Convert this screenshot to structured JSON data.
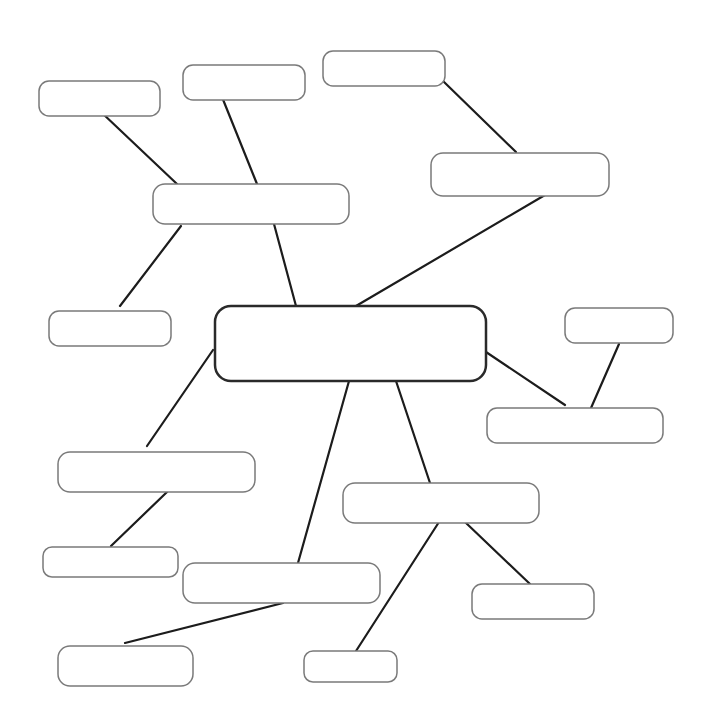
{
  "diagram": {
    "type": "mind-map",
    "width": 708,
    "height": 726,
    "colors": {
      "background": "#ffffff",
      "node_border": "#7a7a7a",
      "central_border": "#2a2a2a",
      "edge": "#1c1c1c"
    },
    "central": {
      "id": "center",
      "label": "",
      "x": 215,
      "y": 306,
      "w": 271,
      "h": 75,
      "r": 16
    },
    "nodes": [
      {
        "id": "a",
        "label": "",
        "x": 39,
        "y": 81,
        "w": 121,
        "h": 35,
        "r": 10
      },
      {
        "id": "b",
        "label": "",
        "x": 183,
        "y": 65,
        "w": 122,
        "h": 35,
        "r": 10
      },
      {
        "id": "c",
        "label": "",
        "x": 323,
        "y": 51,
        "w": 122,
        "h": 35,
        "r": 10
      },
      {
        "id": "d",
        "label": "",
        "x": 153,
        "y": 184,
        "w": 196,
        "h": 40,
        "r": 12
      },
      {
        "id": "e",
        "label": "",
        "x": 431,
        "y": 153,
        "w": 178,
        "h": 43,
        "r": 12
      },
      {
        "id": "f",
        "label": "",
        "x": 49,
        "y": 311,
        "w": 122,
        "h": 35,
        "r": 10
      },
      {
        "id": "g",
        "label": "",
        "x": 565,
        "y": 308,
        "w": 108,
        "h": 35,
        "r": 10
      },
      {
        "id": "h",
        "label": "",
        "x": 487,
        "y": 408,
        "w": 176,
        "h": 35,
        "r": 10
      },
      {
        "id": "i",
        "label": "",
        "x": 58,
        "y": 452,
        "w": 197,
        "h": 40,
        "r": 12
      },
      {
        "id": "j",
        "label": "",
        "x": 343,
        "y": 483,
        "w": 196,
        "h": 40,
        "r": 12
      },
      {
        "id": "k",
        "label": "",
        "x": 43,
        "y": 547,
        "w": 135,
        "h": 30,
        "r": 9
      },
      {
        "id": "l",
        "label": "",
        "x": 183,
        "y": 563,
        "w": 197,
        "h": 40,
        "r": 12
      },
      {
        "id": "m",
        "label": "",
        "x": 472,
        "y": 584,
        "w": 122,
        "h": 35,
        "r": 10
      },
      {
        "id": "n",
        "label": "",
        "x": 58,
        "y": 646,
        "w": 135,
        "h": 40,
        "r": 12
      },
      {
        "id": "o",
        "label": "",
        "x": 304,
        "y": 651,
        "w": 93,
        "h": 31,
        "r": 9
      }
    ],
    "edges": [
      {
        "from": "a",
        "to": "d",
        "x1": 101,
        "y1": 112,
        "x2": 177,
        "y2": 184
      },
      {
        "from": "b",
        "to": "d",
        "x1": 222,
        "y1": 97,
        "x2": 257,
        "y2": 184
      },
      {
        "from": "c",
        "to": "e",
        "x1": 443,
        "y1": 81,
        "x2": 516,
        "y2": 152
      },
      {
        "from": "d",
        "to": "f",
        "x1": 181,
        "y1": 226,
        "x2": 120,
        "y2": 306
      },
      {
        "from": "d",
        "to": "center",
        "x1": 274,
        "y1": 224,
        "x2": 296,
        "y2": 306
      },
      {
        "from": "e",
        "to": "center",
        "x1": 545,
        "y1": 195,
        "x2": 356,
        "y2": 306
      },
      {
        "from": "center",
        "to": "i",
        "x1": 213,
        "y1": 350,
        "x2": 147,
        "y2": 446
      },
      {
        "from": "center",
        "to": "h",
        "x1": 486,
        "y1": 352,
        "x2": 565,
        "y2": 405
      },
      {
        "from": "g",
        "to": "h",
        "x1": 619,
        "y1": 344,
        "x2": 591,
        "y2": 408
      },
      {
        "from": "center",
        "to": "l",
        "x1": 349,
        "y1": 381,
        "x2": 298,
        "y2": 563
      },
      {
        "from": "center",
        "to": "j",
        "x1": 396,
        "y1": 381,
        "x2": 430,
        "y2": 483
      },
      {
        "from": "i",
        "to": "k",
        "x1": 167,
        "y1": 492,
        "x2": 111,
        "y2": 546
      },
      {
        "from": "j",
        "to": "o",
        "x1": 439,
        "y1": 522,
        "x2": 356,
        "y2": 651
      },
      {
        "from": "j",
        "to": "m",
        "x1": 465,
        "y1": 522,
        "x2": 530,
        "y2": 584
      },
      {
        "from": "l",
        "to": "n",
        "x1": 283,
        "y1": 603,
        "x2": 125,
        "y2": 643
      }
    ]
  }
}
